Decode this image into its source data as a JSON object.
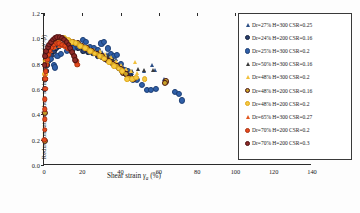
{
  "chart_data": {
    "type": "scatter",
    "title": "",
    "xlabel": "Shear strain γa (%)",
    "ylabel": "Reduction rate of shear resistance angle(φ'/φ)",
    "xlim": [
      0,
      140
    ],
    "ylim": [
      0.0,
      1.2
    ],
    "xticks": [
      "0",
      "20",
      "40",
      "60",
      "80",
      "100",
      "120",
      "140"
    ],
    "xtick_values": [
      0,
      20,
      40,
      60,
      80,
      100,
      120,
      140
    ],
    "yticks": [
      "0.0",
      "0.2",
      "0.4",
      "0.6",
      "0.8",
      "1.0",
      "1.2"
    ],
    "ytick_values": [
      0.0,
      0.2,
      0.4,
      0.6,
      0.8,
      1.0,
      1.2
    ],
    "grid": false,
    "legend_position": "top-right",
    "series": [
      {
        "name": "Dr=27% H=300 CSR=0.25",
        "marker": "triangle",
        "color": "#2d4f86",
        "edge": "#16264a",
        "size": 3.2,
        "points": [
          [
            0.4,
            0.8
          ],
          [
            1.2,
            0.84
          ],
          [
            2.6,
            0.88
          ],
          [
            4.2,
            0.92
          ],
          [
            6.0,
            0.95
          ],
          [
            8.5,
            0.96
          ],
          [
            11.0,
            0.95
          ],
          [
            14.0,
            0.94
          ],
          [
            17.5,
            0.93
          ],
          [
            21.0,
            0.92
          ],
          [
            24.5,
            0.9
          ],
          [
            27.5,
            0.9
          ],
          [
            30.5,
            0.89
          ],
          [
            33.0,
            0.88
          ],
          [
            35.5,
            0.86
          ],
          [
            37.5,
            0.84
          ],
          [
            39.5,
            0.8
          ],
          [
            41.5,
            0.77
          ],
          [
            43.5,
            0.74
          ],
          [
            46.0,
            0.73
          ],
          [
            52.0,
            0.74
          ],
          [
            56.5,
            0.79
          ],
          [
            58.0,
            0.75
          ],
          [
            62.5,
            0.68
          ]
        ]
      },
      {
        "name": "Dr=24% H=200 CSR=0.16",
        "marker": "circle",
        "color": "#2a3f6e",
        "edge": "#12203c",
        "size": 3.4,
        "points": [
          [
            0.3,
            0.6
          ],
          [
            0.5,
            0.68
          ],
          [
            1.0,
            0.74
          ],
          [
            1.8,
            0.79
          ],
          [
            2.8,
            0.83
          ],
          [
            4.0,
            0.87
          ],
          [
            5.2,
            0.9
          ],
          [
            6.5,
            0.92
          ],
          [
            8.0,
            0.94
          ],
          [
            9.5,
            0.95
          ],
          [
            11.5,
            0.95
          ],
          [
            13.5,
            0.94
          ],
          [
            15.5,
            0.93
          ],
          [
            18.0,
            0.92
          ],
          [
            20.5,
            0.9
          ],
          [
            23.0,
            0.89
          ],
          [
            25.5,
            0.88
          ],
          [
            28.0,
            0.86
          ],
          [
            30.5,
            0.85
          ],
          [
            33.0,
            0.83
          ],
          [
            35.0,
            0.81
          ],
          [
            37.0,
            0.79
          ],
          [
            39.0,
            0.76
          ],
          [
            41.0,
            0.74
          ],
          [
            43.0,
            0.72
          ],
          [
            45.0,
            0.7
          ]
        ]
      },
      {
        "name": "Dr=25% H=300 CSR=0.2",
        "marker": "circle",
        "color": "#2f5fa8",
        "edge": "#1c3e74",
        "size": 3.6,
        "points": [
          [
            2.0,
            0.82
          ],
          [
            3.6,
            0.84
          ],
          [
            5.0,
            0.79
          ],
          [
            5.8,
            0.77
          ],
          [
            7.0,
            0.86
          ],
          [
            9.0,
            0.88
          ],
          [
            12.0,
            0.9
          ],
          [
            15.0,
            0.92
          ],
          [
            18.0,
            0.94
          ],
          [
            20.5,
            0.99
          ],
          [
            22.0,
            0.97
          ],
          [
            24.0,
            0.93
          ],
          [
            26.0,
            0.92
          ],
          [
            28.0,
            0.91
          ],
          [
            30.0,
            0.96
          ],
          [
            31.5,
            0.97
          ],
          [
            33.5,
            0.92
          ],
          [
            35.0,
            0.88
          ],
          [
            36.5,
            0.86
          ],
          [
            38.0,
            0.87
          ],
          [
            40.0,
            0.8
          ],
          [
            42.0,
            0.75
          ],
          [
            44.0,
            0.74
          ],
          [
            46.5,
            0.67
          ],
          [
            48.5,
            0.67
          ],
          [
            51.0,
            0.63
          ],
          [
            54.0,
            0.59
          ],
          [
            56.0,
            0.59
          ],
          [
            58.5,
            0.6
          ],
          [
            68.5,
            0.58
          ],
          [
            70.5,
            0.56
          ],
          [
            72.0,
            0.51
          ]
        ]
      },
      {
        "name": "Dr=50% H=300 CSR=0.16",
        "marker": "triangle",
        "color": "#3a3a3a",
        "edge": "#141414",
        "size": 3.2,
        "points": [
          [
            0.5,
            0.79
          ],
          [
            1.5,
            0.85
          ],
          [
            3.0,
            0.92
          ],
          [
            4.5,
            0.96
          ],
          [
            6.0,
            0.99
          ],
          [
            7.5,
            1.0
          ],
          [
            9.0,
            1.0
          ],
          [
            11.0,
            0.99
          ],
          [
            13.5,
            0.97
          ],
          [
            16.0,
            0.96
          ],
          [
            19.0,
            0.94
          ],
          [
            22.0,
            0.93
          ],
          [
            25.0,
            0.91
          ],
          [
            28.0,
            0.89
          ],
          [
            31.0,
            0.87
          ],
          [
            33.5,
            0.86
          ],
          [
            36.0,
            0.84
          ],
          [
            38.5,
            0.8
          ],
          [
            41.0,
            0.77
          ],
          [
            43.5,
            0.75
          ],
          [
            46.0,
            0.74
          ],
          [
            49.0,
            0.76
          ],
          [
            52.0,
            0.75
          ],
          [
            57.0,
            0.75
          ],
          [
            63.0,
            0.66
          ]
        ]
      },
      {
        "name": "Dr=48% H=300 CSR=0.2",
        "marker": "triangle",
        "color": "#f2c13d",
        "edge": "#d49b18",
        "size": 3.2,
        "points": [
          [
            0.6,
            0.8
          ],
          [
            1.6,
            0.86
          ],
          [
            3.2,
            0.93
          ],
          [
            4.8,
            0.97
          ],
          [
            6.4,
            0.99
          ],
          [
            8.0,
            1.0
          ],
          [
            10.0,
            1.0
          ],
          [
            12.5,
            0.98
          ],
          [
            15.0,
            0.97
          ],
          [
            17.5,
            0.96
          ],
          [
            20.0,
            0.95
          ],
          [
            23.0,
            0.93
          ],
          [
            26.0,
            0.91
          ],
          [
            29.0,
            0.9
          ],
          [
            32.0,
            0.88
          ],
          [
            35.0,
            0.85
          ],
          [
            37.5,
            0.82
          ],
          [
            40.0,
            0.79
          ],
          [
            43.0,
            0.76
          ],
          [
            45.5,
            0.74
          ],
          [
            47.5,
            0.81
          ],
          [
            48.5,
            0.73
          ],
          [
            52.5,
            0.68
          ],
          [
            17.0,
            0.79
          ]
        ]
      },
      {
        "name": "Dr=48% H=200 CSR=0.16",
        "marker": "circle",
        "color": "#c9a227",
        "edge": "#4a1616",
        "size": 3.6,
        "points": [
          [
            0.3,
            0.19
          ],
          [
            0.4,
            0.41
          ],
          [
            0.6,
            0.68
          ],
          [
            1.0,
            0.8
          ],
          [
            1.6,
            0.86
          ],
          [
            2.4,
            0.9
          ],
          [
            3.2,
            0.93
          ],
          [
            4.2,
            0.96
          ],
          [
            5.4,
            0.98
          ],
          [
            6.6,
            0.99
          ],
          [
            8.0,
            1.0
          ],
          [
            9.5,
            1.0
          ],
          [
            11.0,
            0.99
          ],
          [
            13.0,
            0.98
          ],
          [
            15.0,
            0.97
          ],
          [
            17.5,
            0.96
          ],
          [
            20.0,
            0.94
          ],
          [
            22.5,
            0.92
          ],
          [
            25.0,
            0.9
          ],
          [
            27.5,
            0.88
          ],
          [
            30.0,
            0.86
          ],
          [
            32.0,
            0.84
          ],
          [
            34.0,
            0.82
          ],
          [
            36.0,
            0.8
          ],
          [
            38.0,
            0.78
          ],
          [
            40.0,
            0.76
          ],
          [
            41.5,
            0.73
          ],
          [
            43.0,
            0.72
          ],
          [
            44.5,
            0.69
          ],
          [
            47.0,
            0.68
          ],
          [
            63.5,
            0.66
          ],
          [
            63.0,
            0.65
          ]
        ]
      },
      {
        "name": "Dr=48% H=200 CSR=0.2",
        "marker": "circle",
        "color": "#f5c842",
        "edge": "#e0a818",
        "size": 3.4,
        "points": [
          [
            0.4,
            0.72
          ],
          [
            1.0,
            0.82
          ],
          [
            2.0,
            0.88
          ],
          [
            3.0,
            0.92
          ],
          [
            4.2,
            0.95
          ],
          [
            5.6,
            0.98
          ],
          [
            7.0,
            0.99
          ],
          [
            8.6,
            1.0
          ],
          [
            10.5,
            1.0
          ],
          [
            12.5,
            0.99
          ],
          [
            14.5,
            0.97
          ],
          [
            16.5,
            0.96
          ],
          [
            19.0,
            0.94
          ],
          [
            21.5,
            0.92
          ],
          [
            24.0,
            0.9
          ],
          [
            26.5,
            0.88
          ],
          [
            29.0,
            0.86
          ],
          [
            31.5,
            0.84
          ],
          [
            34.0,
            0.81
          ],
          [
            36.5,
            0.78
          ],
          [
            39.0,
            0.76
          ],
          [
            41.0,
            0.74
          ],
          [
            43.5,
            0.68
          ],
          [
            46.0,
            0.68
          ],
          [
            48.0,
            0.69
          ],
          [
            52.5,
            0.68
          ]
        ]
      },
      {
        "name": "Dr=65% H=300 CSR=0.27",
        "marker": "triangle",
        "color": "#e2571f",
        "edge": "#b53c10",
        "size": 3.2,
        "points": [
          [
            0.3,
            0.72
          ],
          [
            0.8,
            0.8
          ],
          [
            1.5,
            0.85
          ],
          [
            2.4,
            0.88
          ],
          [
            3.4,
            0.9
          ],
          [
            4.6,
            0.92
          ],
          [
            6.0,
            0.93
          ],
          [
            7.6,
            0.94
          ],
          [
            9.2,
            0.94
          ],
          [
            10.8,
            0.93
          ],
          [
            12.4,
            0.92
          ],
          [
            14.0,
            0.9
          ],
          [
            15.5,
            0.87
          ],
          [
            16.8,
            0.84
          ],
          [
            17.6,
            0.8
          ]
        ]
      },
      {
        "name": "Dr=70% H=200 CSR=0.2",
        "marker": "circle",
        "color": "#e8491c",
        "edge": "#a93212",
        "size": 3.2,
        "points": [
          [
            0.25,
            0.2
          ],
          [
            0.3,
            0.28
          ],
          [
            0.35,
            0.36
          ],
          [
            0.4,
            0.44
          ],
          [
            0.5,
            0.52
          ],
          [
            0.6,
            0.6
          ],
          [
            0.75,
            0.68
          ],
          [
            0.9,
            0.74
          ],
          [
            1.2,
            0.79
          ],
          [
            1.6,
            0.83
          ],
          [
            2.2,
            0.87
          ],
          [
            3.0,
            0.9
          ],
          [
            4.0,
            0.93
          ],
          [
            5.2,
            0.95
          ],
          [
            6.6,
            0.96
          ],
          [
            8.0,
            0.96
          ],
          [
            9.5,
            0.95
          ],
          [
            11.0,
            0.94
          ],
          [
            12.5,
            0.92
          ],
          [
            14.0,
            0.9
          ],
          [
            15.0,
            0.88
          ],
          [
            16.0,
            0.85
          ],
          [
            16.8,
            0.82
          ],
          [
            17.4,
            0.79
          ]
        ]
      },
      {
        "name": "Dr=70% H=200 CSR=0.3",
        "marker": "circle",
        "color": "#8e2a28",
        "edge": "#4d1110",
        "size": 3.4,
        "points": [
          [
            0.3,
            0.79
          ],
          [
            0.7,
            0.86
          ],
          [
            1.3,
            0.9
          ],
          [
            2.0,
            0.93
          ],
          [
            2.8,
            0.95
          ],
          [
            3.8,
            0.97
          ],
          [
            4.8,
            0.99
          ],
          [
            5.8,
            1.0
          ],
          [
            7.0,
            1.01
          ],
          [
            8.2,
            1.01
          ],
          [
            9.4,
            1.0
          ],
          [
            10.6,
            0.99
          ],
          [
            11.8,
            0.97
          ],
          [
            12.8,
            0.95
          ],
          [
            13.8,
            0.92
          ],
          [
            14.8,
            0.89
          ],
          [
            15.6,
            0.86
          ],
          [
            16.4,
            0.83
          ]
        ]
      }
    ]
  }
}
